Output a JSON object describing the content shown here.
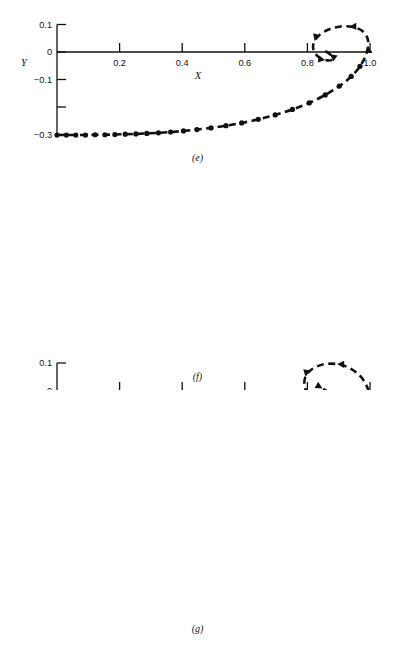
{
  "figure": {
    "type": "multi-panel-phase-plot",
    "panel_count": 3,
    "background": "#ffffff",
    "ink": "#111111"
  },
  "chart_data": [
    {
      "type": "line",
      "panel": "e",
      "caption": "(e)",
      "title": "",
      "xlabel": "X",
      "ylabel": "Y",
      "xlim": [
        0.0,
        1.02
      ],
      "ylim": [
        -0.32,
        0.1
      ],
      "grid": false,
      "legend": "none",
      "xticks": [
        0.0,
        0.2,
        0.4,
        0.6,
        0.8,
        1.0
      ],
      "xticklabels": [
        "",
        "0.2",
        "0.4",
        "0.6",
        "0.8",
        "1.0"
      ],
      "yticks": [
        0.1,
        0.0,
        -0.1,
        -0.2,
        -0.3
      ],
      "yticklabels": [
        "0.1",
        "0",
        "-0.1",
        "",
        "-0.3"
      ],
      "marker": "filled-circle",
      "linestyle": "dashed",
      "focus": [
        0.855,
        -0.012
      ],
      "spiral_turns": 2.1,
      "start_point": [
        0.0,
        -0.302
      ],
      "asymptote_y": -0.302,
      "entry_x": 1.0,
      "arrow_count": 5,
      "series": [
        {
          "name": "trajectory-e",
          "x": [
            0.0,
            0.03,
            0.06,
            0.091,
            0.122,
            0.153,
            0.185,
            0.218,
            0.252,
            0.287,
            0.324,
            0.363,
            0.404,
            0.447,
            0.492,
            0.54,
            0.59,
            0.643,
            0.697,
            0.752,
            0.806,
            0.857,
            0.902,
            0.94,
            0.968,
            0.986,
            0.994,
            0.992,
            0.98,
            0.96,
            0.934,
            0.906,
            0.878,
            0.854,
            0.835,
            0.823,
            0.818,
            0.821,
            0.83,
            0.843,
            0.857,
            0.869,
            0.877,
            0.88,
            0.878,
            0.872,
            0.865,
            0.858,
            0.853,
            0.851,
            0.852
          ],
          "y": [
            -0.302,
            -0.302,
            -0.302,
            -0.302,
            -0.301,
            -0.301,
            -0.3,
            -0.299,
            -0.298,
            -0.296,
            -0.294,
            -0.291,
            -0.287,
            -0.282,
            -0.276,
            -0.268,
            -0.258,
            -0.245,
            -0.229,
            -0.209,
            -0.185,
            -0.156,
            -0.124,
            -0.089,
            -0.052,
            -0.014,
            0.022,
            0.05,
            0.072,
            0.086,
            0.093,
            0.093,
            0.086,
            0.074,
            0.058,
            0.04,
            0.021,
            0.003,
            -0.012,
            -0.023,
            -0.029,
            -0.031,
            -0.029,
            -0.023,
            -0.016,
            -0.008,
            -0.002,
            0.002,
            0.004,
            0.003,
            0.001
          ]
        }
      ]
    },
    {
      "type": "line",
      "panel": "f",
      "caption": "(f)",
      "title": "",
      "xlabel": "X",
      "ylabel": "Y",
      "xlim": [
        0.0,
        1.02
      ],
      "ylim": [
        -0.5,
        0.1
      ],
      "grid": false,
      "legend": "none",
      "xticks": [
        0.0,
        0.2,
        0.4,
        0.6,
        0.8,
        1.0
      ],
      "xticklabels": [
        "",
        "0.2",
        "0.4",
        "0.6",
        "0.8",
        "1.0"
      ],
      "yticks": [
        0.1,
        0.0,
        -0.1,
        -0.2,
        -0.3,
        -0.4,
        -0.5
      ],
      "yticklabels": [
        "0.1",
        "0",
        "-0.1",
        "",
        "-0.3",
        "",
        "-0.5"
      ],
      "marker": "filled-circle",
      "linestyle": "dashed",
      "focus": [
        0.872,
        -0.016
      ],
      "spiral_turns": 2.6,
      "start_point": [
        0.0,
        -0.443
      ],
      "asymptote_y": -0.443,
      "entry_x": 1.0,
      "arrow_count": 6,
      "series": [
        {
          "name": "trajectory-f",
          "x": [
            0.0,
            0.03,
            0.061,
            0.092,
            0.124,
            0.156,
            0.189,
            0.223,
            0.258,
            0.294,
            0.331,
            0.37,
            0.41,
            0.452,
            0.496,
            0.542,
            0.59,
            0.64,
            0.692,
            0.745,
            0.798,
            0.849,
            0.896,
            0.937,
            0.969,
            0.991,
            1.0,
            0.997,
            0.983,
            0.96,
            0.929,
            0.895,
            0.861,
            0.831,
            0.808,
            0.794,
            0.79,
            0.795,
            0.808,
            0.826,
            0.846,
            0.864,
            0.877,
            0.884,
            0.884,
            0.877,
            0.868,
            0.858,
            0.85,
            0.847,
            0.848,
            0.854,
            0.861,
            0.867,
            0.869,
            0.868,
            0.864,
            0.86,
            0.858,
            0.858,
            0.86
          ],
          "y": [
            -0.443,
            -0.443,
            -0.443,
            -0.443,
            -0.442,
            -0.441,
            -0.44,
            -0.439,
            -0.437,
            -0.434,
            -0.431,
            -0.427,
            -0.422,
            -0.416,
            -0.408,
            -0.398,
            -0.386,
            -0.371,
            -0.353,
            -0.331,
            -0.304,
            -0.272,
            -0.235,
            -0.194,
            -0.149,
            -0.101,
            -0.052,
            -0.007,
            0.032,
            0.063,
            0.085,
            0.096,
            0.097,
            0.088,
            0.072,
            0.051,
            0.027,
            0.003,
            -0.018,
            -0.035,
            -0.046,
            -0.051,
            -0.049,
            -0.042,
            -0.031,
            -0.019,
            -0.008,
            0.001,
            0.007,
            0.01,
            0.009,
            0.005,
            0.0,
            -0.005,
            -0.009,
            -0.011,
            -0.011,
            -0.009,
            -0.006,
            -0.003,
            -0.001
          ]
        }
      ]
    },
    {
      "type": "line",
      "panel": "g",
      "caption": "(g)",
      "title": "",
      "xlabel": "X",
      "ylabel": "Y",
      "xlim": [
        0.0,
        1.02
      ],
      "ylim": [
        -0.6,
        0.1
      ],
      "grid": false,
      "legend": "none",
      "xticks": [
        0.0,
        0.2,
        0.4,
        0.6,
        0.8,
        1.0
      ],
      "xticklabels": [
        "",
        "0.2",
        "0.4",
        "0.6",
        "0.8",
        "1.0"
      ],
      "yticks": [
        0.1,
        0.0,
        -0.1,
        -0.2,
        -0.3,
        -0.4,
        -0.5,
        -0.6
      ],
      "yticklabels": [
        "0.1",
        "0",
        "",
        "-0.2",
        "",
        "-0.4",
        "",
        "-0.6"
      ],
      "marker": "filled-circle",
      "linestyle": "dashed",
      "focus": [
        0.845,
        -0.048
      ],
      "spiral_turns": 2.7,
      "start_point": [
        0.0,
        -0.552
      ],
      "asymptote_y": -0.552,
      "entry_x": 1.0,
      "arrow_count": 7,
      "series": [
        {
          "name": "trajectory-g",
          "x": [
            0.0,
            0.031,
            0.062,
            0.094,
            0.126,
            0.159,
            0.193,
            0.228,
            0.264,
            0.301,
            0.339,
            0.379,
            0.42,
            0.463,
            0.507,
            0.553,
            0.6,
            0.649,
            0.699,
            0.75,
            0.8,
            0.849,
            0.895,
            0.936,
            0.97,
            0.994,
            1.004,
            0.999,
            0.98,
            0.95,
            0.912,
            0.869,
            0.827,
            0.791,
            0.766,
            0.754,
            0.755,
            0.768,
            0.791,
            0.818,
            0.845,
            0.868,
            0.884,
            0.89,
            0.885,
            0.871,
            0.853,
            0.835,
            0.821,
            0.815,
            0.817,
            0.826,
            0.839,
            0.851,
            0.859,
            0.861,
            0.857,
            0.849,
            0.841,
            0.836,
            0.836
          ],
          "y": [
            -0.552,
            -0.552,
            -0.552,
            -0.551,
            -0.55,
            -0.549,
            -0.547,
            -0.545,
            -0.542,
            -0.538,
            -0.534,
            -0.528,
            -0.521,
            -0.513,
            -0.503,
            -0.491,
            -0.476,
            -0.458,
            -0.436,
            -0.41,
            -0.379,
            -0.342,
            -0.3,
            -0.252,
            -0.199,
            -0.143,
            -0.085,
            -0.028,
            0.022,
            0.062,
            0.088,
            0.098,
            0.091,
            0.069,
            0.038,
            0.003,
            -0.033,
            -0.066,
            -0.094,
            -0.113,
            -0.121,
            -0.118,
            -0.105,
            -0.085,
            -0.061,
            -0.037,
            -0.016,
            0.0,
            0.008,
            0.008,
            0.001,
            -0.01,
            -0.024,
            -0.037,
            -0.048,
            -0.055,
            -0.057,
            -0.054,
            -0.048,
            -0.042,
            -0.04
          ]
        }
      ]
    }
  ]
}
